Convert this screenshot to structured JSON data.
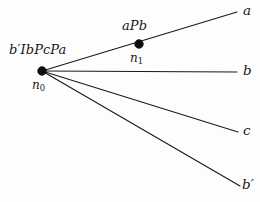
{
  "diagram": {
    "type": "tree",
    "background_color": "#fdfdfd",
    "line_color": "#1a1a1a",
    "text_color": "#171717",
    "nodes": [
      {
        "id": "n0",
        "name_label": "n",
        "name_subscript": "0",
        "formula_label": "b′IbPcPa",
        "x": 42,
        "y": 71,
        "radius": 4.4
      },
      {
        "id": "n1",
        "name_label": "n",
        "name_subscript": "1",
        "formula_label": "aPb",
        "x": 139,
        "y": 44,
        "radius": 4.4
      }
    ],
    "edges": [
      {
        "from": "n0",
        "to": "leaf_a",
        "x1": 42,
        "y1": 71,
        "x2": 237,
        "y2": 12
      },
      {
        "from": "n0",
        "to": "leaf_b",
        "x1": 42,
        "y1": 71,
        "x2": 237,
        "y2": 72
      },
      {
        "from": "n0",
        "to": "leaf_c",
        "x1": 42,
        "y1": 71,
        "x2": 238,
        "y2": 132
      },
      {
        "from": "n0",
        "to": "leaf_bp",
        "x1": 42,
        "y1": 71,
        "x2": 240,
        "y2": 186
      }
    ],
    "leaves": [
      {
        "id": "leaf_a",
        "label": "a",
        "prime": "",
        "x": 243,
        "y": 12
      },
      {
        "id": "leaf_b",
        "label": "b",
        "prime": "",
        "x": 243,
        "y": 72
      },
      {
        "id": "leaf_c",
        "label": "c",
        "prime": "",
        "x": 243,
        "y": 132
      },
      {
        "id": "leaf_bp",
        "label": "b",
        "prime": "′",
        "x": 242,
        "y": 186
      }
    ]
  }
}
